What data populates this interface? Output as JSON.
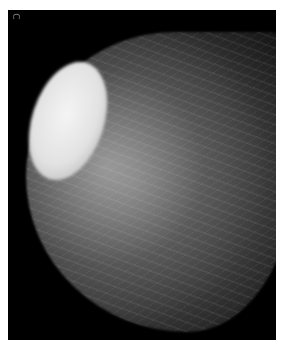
{
  "image": {
    "description": "Grayscale mammogram with a large, well-circumscribed oval bright mass in the upper-left region",
    "marker_label": "C",
    "colors": {
      "background": "#000000",
      "border": "#ffffff",
      "mass": "#e8e8e8"
    }
  }
}
